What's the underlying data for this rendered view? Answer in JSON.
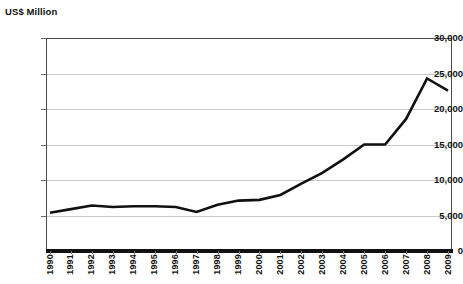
{
  "chart_data": {
    "type": "line",
    "title": "",
    "ylabel": "US$ Million",
    "xlabel": "",
    "ylim": [
      0,
      30000
    ],
    "ytick_labels": [
      "0",
      "5,000",
      "10,000",
      "15,000",
      "20,000",
      "25,000",
      "30,000"
    ],
    "ytick_values": [
      0,
      5000,
      10000,
      15000,
      20000,
      25000,
      30000
    ],
    "grid": true,
    "legend": "none",
    "categories": [
      "1990",
      "1991",
      "1992",
      "1993",
      "1994",
      "1995",
      "1996",
      "1997",
      "1998",
      "1999",
      "2000",
      "2001",
      "2002",
      "2003",
      "2004",
      "2005",
      "2006",
      "2007",
      "2008",
      "2009"
    ],
    "values": [
      5400,
      5900,
      6400,
      6200,
      6300,
      6300,
      6200,
      5500,
      6500,
      7100,
      7200,
      7900,
      9500,
      11000,
      12900,
      15000,
      15000,
      18600,
      24300,
      22600
    ],
    "series": [
      {
        "name": "US$ Million",
        "values": [
          5400,
          5900,
          6400,
          6200,
          6300,
          6300,
          6200,
          5500,
          6500,
          7100,
          7200,
          7900,
          9500,
          11000,
          12900,
          15000,
          15000,
          18600,
          24300,
          22600
        ]
      }
    ],
    "line_color": "#111111",
    "grid_color": "#c9c9c9",
    "axis_color": "#4a4a4a"
  }
}
